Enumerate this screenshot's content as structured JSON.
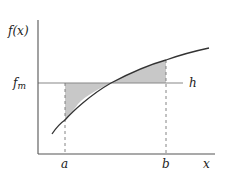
{
  "diagram": {
    "y_label": "f(x)",
    "fm_label": "f",
    "fm_sub": "m",
    "h_label": "h",
    "x_label": "x",
    "a_label": "a",
    "b_label": "b",
    "colors": {
      "axis": "#555555",
      "curve": "#333333",
      "hline": "#888888",
      "fill": "#c8c8c8",
      "dashed": "#777777",
      "text": "#222222"
    }
  }
}
